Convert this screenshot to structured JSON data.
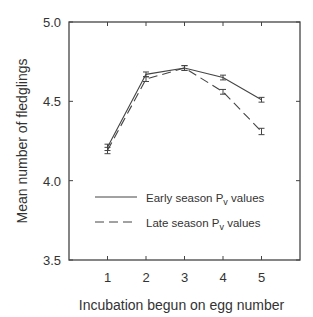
{
  "chart_data": {
    "type": "line",
    "title": "",
    "xlabel": "Incubation begun on egg number",
    "ylabel": "Mean number of fledglings",
    "x": [
      1,
      2,
      3,
      4,
      5
    ],
    "xlim": [
      0,
      6
    ],
    "ylim": [
      3.5,
      5.0
    ],
    "yticks": [
      "3.5",
      "4.0",
      "4.5",
      "5.0"
    ],
    "xticks": [
      "1",
      "2",
      "3",
      "4",
      "5"
    ],
    "grid": false,
    "legend_position": "lower left inside",
    "series": [
      {
        "name": "Early season Pv values",
        "style": "solid",
        "values": [
          4.21,
          4.67,
          4.71,
          4.65,
          4.51
        ],
        "err": [
          0.02,
          0.015,
          0.015,
          0.015,
          0.015
        ]
      },
      {
        "name": "Late season Pv values",
        "style": "dashed",
        "values": [
          4.19,
          4.64,
          4.71,
          4.56,
          4.31
        ],
        "err": [
          0.02,
          0.015,
          0.015,
          0.015,
          0.02
        ]
      }
    ]
  },
  "legend": {
    "early": {
      "prefix": "Early season P",
      "sub": "v",
      "suffix": " values"
    },
    "late": {
      "prefix": "Late season P",
      "sub": "v",
      "suffix": " values"
    }
  }
}
